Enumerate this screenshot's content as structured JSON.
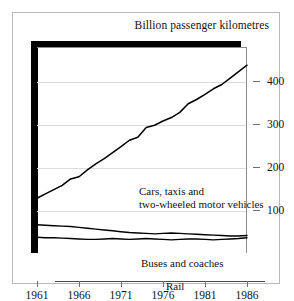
{
  "chart_data": {
    "type": "line",
    "title": "Billion passenger kilometres",
    "xlabel": "",
    "ylabel": "",
    "xlim": [
      1961,
      1986
    ],
    "ylim": [
      0,
      480
    ],
    "yticks": [
      100,
      200,
      300,
      400
    ],
    "xticks": [
      1961,
      1966,
      1971,
      1976,
      1981,
      1986
    ],
    "grid": true,
    "legend_position": "inline-annotations",
    "x": [
      1961,
      1962,
      1963,
      1964,
      1965,
      1966,
      1967,
      1968,
      1969,
      1970,
      1971,
      1972,
      1973,
      1974,
      1975,
      1976,
      1977,
      1978,
      1979,
      1980,
      1981,
      1982,
      1983,
      1984,
      1985,
      1986
    ],
    "series": [
      {
        "name": "Cars, taxis and two-wheeled motor vehicles",
        "values": [
          130,
          140,
          150,
          160,
          175,
          180,
          196,
          210,
          222,
          236,
          250,
          265,
          272,
          295,
          300,
          310,
          318,
          330,
          350,
          360,
          372,
          385,
          395,
          410,
          425,
          440
        ]
      },
      {
        "name": "Buses and coaches",
        "values": [
          68,
          67,
          66,
          65,
          64,
          62,
          60,
          58,
          56,
          54,
          52,
          50,
          49,
          48,
          47,
          48,
          49,
          48,
          47,
          46,
          45,
          44,
          43,
          42,
          42,
          43
        ]
      },
      {
        "name": "Rail",
        "values": [
          39,
          38,
          38,
          37,
          36,
          35,
          34,
          34,
          35,
          36,
          35,
          34,
          35,
          36,
          35,
          34,
          33,
          34,
          35,
          35,
          34,
          33,
          34,
          35,
          36,
          38
        ]
      }
    ],
    "annotations": [
      {
        "id": "cars",
        "text_line1": "Cars, taxis and",
        "text_line2": "two-wheeled motor vehicles"
      },
      {
        "id": "buses",
        "text_line1": "Buses and coaches",
        "text_line2": ""
      },
      {
        "id": "rail",
        "text_line1": "Rail",
        "text_line2": ""
      }
    ],
    "colors": {
      "line": "#000000",
      "grid": "#dcdcdc",
      "axis": "#4a4a4a",
      "frame": "#b9b9b9",
      "heavy_rule": "#000000",
      "background": "#ffffff"
    }
  }
}
